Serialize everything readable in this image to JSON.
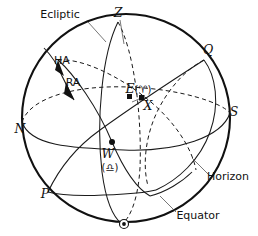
{
  "figure": {
    "kind": "celestial-sphere-diagram",
    "background_color": "#ffffff",
    "ink_color": "#111111",
    "width": 258,
    "height": 236
  },
  "labels": {
    "ecliptic": "Ecliptic",
    "equator": "Equator",
    "horizon": "Horizon",
    "zenith": "Z",
    "pole": "P",
    "equator_upper": "Q",
    "north": "N",
    "south": "S",
    "east": "E",
    "east_symbol": "(♈)",
    "west": "W",
    "west_symbol": "(♎)",
    "star": "X",
    "hour_angle": "HA",
    "right_ascension": "RA"
  },
  "points": {
    "zenith": {
      "label": "Z",
      "x": 118,
      "y": 20,
      "marker": "none"
    },
    "nadir": {
      "label": "",
      "x": 124,
      "y": 224,
      "marker": "ring-dot"
    },
    "east": {
      "label": "E",
      "x": 130,
      "y": 97,
      "marker": "square"
    },
    "star": {
      "label": "X",
      "x": 142,
      "y": 98,
      "marker": "square"
    },
    "west": {
      "label": "W",
      "x": 112,
      "y": 142,
      "marker": "dot"
    },
    "north": {
      "label": "N",
      "x": 25,
      "y": 122,
      "marker": "none"
    },
    "south": {
      "label": "S",
      "x": 230,
      "y": 113,
      "marker": "none"
    },
    "pole": {
      "label": "P",
      "x": 47,
      "y": 192,
      "marker": "none"
    },
    "equator_upper": {
      "label": "Q",
      "x": 205,
      "y": 56,
      "marker": "none"
    }
  },
  "circles": {
    "sphere": {
      "name": "sphere-outline",
      "cx": 126,
      "cy": 118,
      "r": 104
    },
    "horizon": {
      "name": "horizon-circle",
      "note": "tilted ellipse, dashed on far half, solid on near half"
    },
    "equator": {
      "name": "equator-circle",
      "note": "great circle from Q through centre to P"
    },
    "meridian": {
      "name": "meridian-circle",
      "note": "narrow ellipse from zenith Z to nadir"
    },
    "ecliptic": {
      "name": "ecliptic-circle",
      "note": "tilted great circle through E and W"
    }
  },
  "annotations": {
    "ecliptic_leader": "leader line from Ecliptic text to sphere rim",
    "equator_leader": "leader line from Equator text to equator arc",
    "horizon_leader": "leader line from Horizon text to horizon arc",
    "ha_arrow": "arrowhead on hour-angle arc",
    "ra_arrow": "arrowhead on right-ascension arc"
  }
}
